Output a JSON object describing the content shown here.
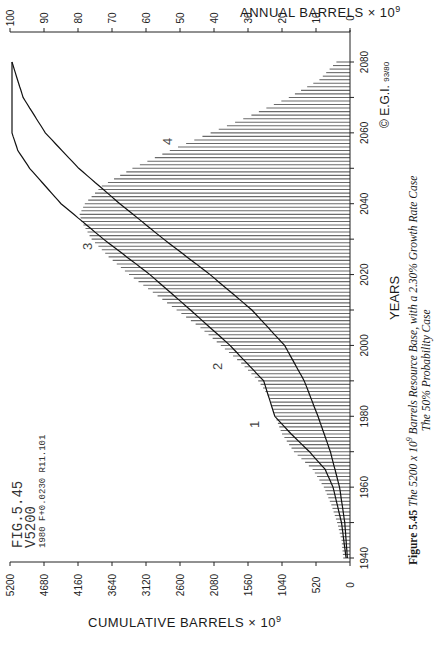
{
  "chart_data": {
    "type": "bar",
    "orientation": "rotated -90deg (years run bottom-to-top on page)",
    "subtitle": "The 50% Probability Case",
    "plot_label": [
      "FIG.5.45",
      "V5200",
      "1980 F+0.0230 R11.101"
    ],
    "xlabel": "YEARS",
    "ylabel_left": "ANNUAL BARRELS × 10^9",
    "ylabel_right": "CUMULATIVE BARRELS × 10^9",
    "x_ticks": [
      1940,
      1960,
      1980,
      2000,
      2020,
      2040,
      2060,
      2080
    ],
    "annual_ticks": [
      0,
      10,
      20,
      30,
      40,
      50,
      60,
      70,
      80,
      90,
      100
    ],
    "cumulative_ticks": [
      0,
      520,
      1040,
      1560,
      2080,
      2600,
      3120,
      3640,
      4160,
      4680,
      5200
    ],
    "annual_range": [
      0,
      100
    ],
    "cumulative_range": [
      0,
      5200
    ],
    "x_range": [
      1940,
      2080
    ],
    "curve_labels": [
      "1",
      "2",
      "3",
      "4"
    ],
    "copyright": "© E.G.I. 93/80",
    "series": [
      {
        "name": "Annual production (bars)",
        "type": "bar",
        "x": [
          1940,
          1945,
          1950,
          1955,
          1960,
          1965,
          1970,
          1975,
          1980,
          1985,
          1990,
          1995,
          2000,
          2005,
          2010,
          2015,
          2020,
          2025,
          2030,
          2035,
          2037,
          2040,
          2045,
          2050,
          2055,
          2060,
          2065,
          2070,
          2075,
          2080
        ],
        "values": [
          2,
          2.5,
          3.8,
          5.5,
          7.7,
          11,
          16.5,
          20,
          22,
          23.5,
          27,
          32,
          38,
          44,
          51,
          58,
          65,
          71,
          76,
          79,
          79.5,
          78,
          73,
          64,
          53,
          41,
          29,
          18,
          9,
          4
        ]
      },
      {
        "name": "Cumulative curve (lower)",
        "type": "line",
        "x": [
          1940,
          1950,
          1960,
          1970,
          1980,
          1990,
          2000,
          2010,
          2020,
          2030,
          2040,
          2050,
          2060,
          2070,
          2080
        ],
        "values": [
          40,
          80,
          160,
          300,
          490,
          700,
          1000,
          1500,
          2140,
          2850,
          3520,
          4150,
          4660,
          5000,
          5170
        ]
      },
      {
        "name": "Cumulative curve (upper)",
        "type": "line",
        "x": [
          1940,
          1950,
          1960,
          1965,
          1970,
          1975,
          1980,
          1990,
          2000,
          2010,
          2020,
          2030,
          2040,
          2050,
          2055,
          2060,
          2080
        ],
        "values": [
          60,
          130,
          260,
          380,
          620,
          900,
          1150,
          1320,
          1835,
          2440,
          3060,
          3770,
          4420,
          4900,
          5080,
          5170,
          5170
        ]
      }
    ]
  },
  "labels": {
    "annual_axis_title": "ANNUAL  BARRELS × 10",
    "annual_axis_sup": "9",
    "cumulative_axis_title": "CUMULATIVE  BARRELS × 10",
    "cumulative_axis_sup": "9",
    "years_title": "YEARS",
    "fig_line1": "FIG.5.45",
    "fig_line2": "V5200",
    "fig_line3": "1980 F+0.0230 R11.101",
    "copyright": "© E.G.I.",
    "copyright_code": "93/80",
    "caption_bold": "Figure 5.45",
    "caption_italic_a": " The 5200 x 10",
    "caption_sup": "9",
    "caption_italic_b": " Barrels Resource Base, with a 2.30% Growth Rate Case",
    "caption_line2": "The 50% Probability Case"
  }
}
